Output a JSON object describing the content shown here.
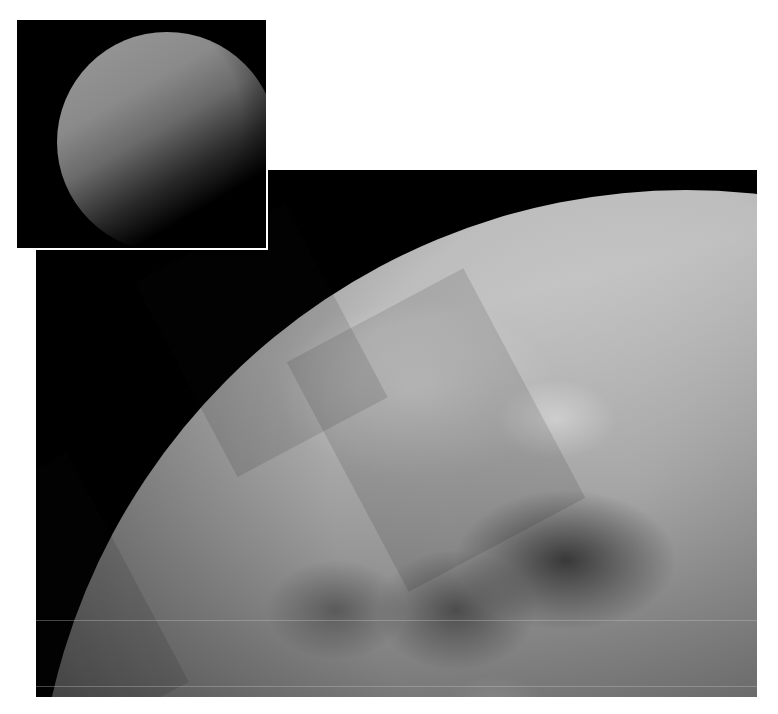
{
  "figure": {
    "main_image": {
      "alt": "Near-infrared mosaic of Titan's northern hemisphere showing lakes and clouds",
      "colors": {
        "background": "#000000",
        "haze": "#d4d4d4",
        "dark_terrain": "#3a3a3a"
      }
    },
    "inset_image": {
      "alt": "Visible-light view of Titan showing hazy atmosphere",
      "colors": {
        "background": "#000000",
        "limb": "#9a9a9a",
        "border": "#ffffff"
      }
    },
    "page_background": "#ffffff"
  }
}
